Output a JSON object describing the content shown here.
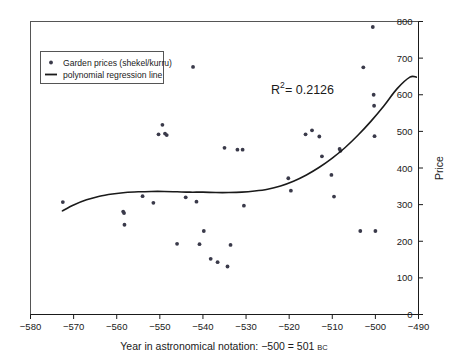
{
  "chart_data": {
    "type": "scatter",
    "title": "",
    "xlabel": "Year in astronomical notation: −500 = 501 BC",
    "xlabel_main": "Year in astronomical notation: −500 = 501",
    "xlabel_suffix": "BC",
    "ylabel": "Price",
    "xlim": [
      -580,
      -490
    ],
    "ylim": [
      0,
      800
    ],
    "xticks": [
      "−580",
      "−570",
      "−560",
      "−550",
      "−540",
      "−530",
      "−520",
      "−510",
      "−500",
      "−490"
    ],
    "xtick_values": [
      -580,
      -570,
      -560,
      -550,
      -540,
      -530,
      -520,
      -510,
      -500,
      -490
    ],
    "yticks": [
      "0",
      "100",
      "200",
      "300",
      "400",
      "500",
      "600",
      "700",
      "800"
    ],
    "ytick_values": [
      0,
      100,
      200,
      300,
      400,
      500,
      600,
      700,
      800
    ],
    "grid": false,
    "legend_position": "upper-left",
    "annotations": [
      {
        "text": "R",
        "sup": "2",
        "rest": " = 0.2126",
        "full": "R² = 0.2126",
        "x": -518.5,
        "y": 620
      }
    ],
    "series": [
      {
        "name": "Garden prices (shekel/kurru)",
        "type": "scatter",
        "marker": "point",
        "color": "#3a3a4a",
        "points": [
          [
            -572.5,
            307
          ],
          [
            -558.5,
            281
          ],
          [
            -558.3,
            277
          ],
          [
            -558.2,
            245
          ],
          [
            -554.0,
            323
          ],
          [
            -551.5,
            305
          ],
          [
            -550.3,
            492
          ],
          [
            -549.4,
            518
          ],
          [
            -548.8,
            494
          ],
          [
            -548.4,
            490
          ],
          [
            -546.0,
            193
          ],
          [
            -544.0,
            320
          ],
          [
            -542.3,
            676
          ],
          [
            -541.5,
            308
          ],
          [
            -540.8,
            192
          ],
          [
            -539.8,
            228
          ],
          [
            -538.2,
            152
          ],
          [
            -536.6,
            143
          ],
          [
            -535.0,
            455
          ],
          [
            -534.3,
            131
          ],
          [
            -533.6,
            190
          ],
          [
            -532.0,
            450
          ],
          [
            -530.8,
            450
          ],
          [
            -530.5,
            297
          ],
          [
            -520.2,
            372
          ],
          [
            -519.6,
            338
          ],
          [
            -516.2,
            492
          ],
          [
            -514.7,
            503
          ],
          [
            -513.0,
            486
          ],
          [
            -512.4,
            432
          ],
          [
            -510.2,
            381
          ],
          [
            -509.6,
            322
          ],
          [
            -508.3,
            452
          ],
          [
            -508.1,
            447
          ],
          [
            -503.5,
            228
          ],
          [
            -502.8,
            675
          ],
          [
            -500.6,
            785
          ],
          [
            -500.4,
            600
          ],
          [
            -500.3,
            570
          ],
          [
            -500.2,
            487
          ],
          [
            -500.0,
            228
          ]
        ]
      },
      {
        "name": "polynomial regression line",
        "type": "line",
        "color": "#1a1a1a",
        "points": [
          [
            -572.6,
            283
          ],
          [
            -570.0,
            299
          ],
          [
            -567.0,
            313
          ],
          [
            -564.0,
            323
          ],
          [
            -561.0,
            329
          ],
          [
            -558.0,
            333
          ],
          [
            -555.0,
            335
          ],
          [
            -552.0,
            336
          ],
          [
            -549.0,
            336
          ],
          [
            -546.0,
            335
          ],
          [
            -543.0,
            334
          ],
          [
            -540.0,
            334
          ],
          [
            -537.0,
            333
          ],
          [
            -534.0,
            333
          ],
          [
            -531.0,
            334
          ],
          [
            -528.0,
            337
          ],
          [
            -525.0,
            342
          ],
          [
            -522.0,
            351
          ],
          [
            -519.0,
            364
          ],
          [
            -516.0,
            381
          ],
          [
            -513.0,
            402
          ],
          [
            -510.0,
            427
          ],
          [
            -507.0,
            456
          ],
          [
            -504.0,
            490
          ],
          [
            -501.0,
            528
          ],
          [
            -498.0,
            570
          ],
          [
            -495.0,
            616
          ],
          [
            -492.0,
            648
          ],
          [
            -490.5,
            648
          ]
        ]
      }
    ]
  },
  "legend": {
    "items": [
      {
        "label": "Garden prices (shekel/kurru)",
        "symbol": "point-marker"
      },
      {
        "label": "polynomial regression line",
        "symbol": "line-segment"
      }
    ]
  },
  "colors": {
    "marker": "#3a3a4a",
    "line": "#1a1a1a",
    "frame": "#555555",
    "axis": "#1a1a1a",
    "background": "#ffffff"
  }
}
